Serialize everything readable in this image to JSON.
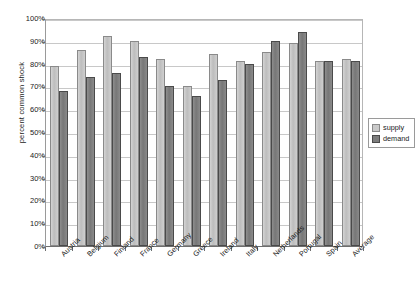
{
  "chart_data": {
    "type": "bar",
    "title": "",
    "xlabel": "",
    "ylabel": "percent common shock",
    "ylim": [
      0,
      100
    ],
    "ytick_labels": [
      "100%",
      "90%",
      "80%",
      "70%",
      "60%",
      "50%",
      "40%",
      "30%",
      "20%",
      "10%",
      "0%"
    ],
    "ytick_values": [
      100,
      90,
      80,
      70,
      60,
      50,
      40,
      30,
      20,
      10,
      0
    ],
    "grid": true,
    "legend_position": "right",
    "categories": [
      "Austria",
      "Belgium",
      "Finland",
      "France",
      "Germany",
      "Greece",
      "Ireland",
      "Italy",
      "Netherlands",
      "Portugal",
      "Spain",
      "Average"
    ],
    "series": [
      {
        "name": "supply",
        "color": "#c9c9c9",
        "values": [
          79,
          86,
          92,
          90,
          82,
          70,
          84,
          81,
          85,
          89,
          81,
          82
        ]
      },
      {
        "name": "demand",
        "color": "#7d7d7d",
        "values": [
          68,
          74,
          76,
          83,
          70,
          66,
          73,
          80,
          90,
          94,
          81,
          81
        ]
      }
    ]
  },
  "legend": {
    "items": [
      {
        "label": "supply",
        "swatch": "supply-swatch"
      },
      {
        "label": "demand",
        "swatch": "demand-swatch"
      }
    ]
  }
}
